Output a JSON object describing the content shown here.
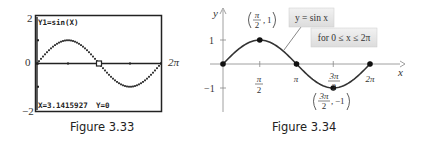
{
  "figures": [
    {
      "caption": "Figure 3.33",
      "chart_data": {
        "type": "line",
        "title": "Y1=sin(X)",
        "function": "sin(x)",
        "x_range": [
          0,
          6.2832
        ],
        "ylim": [
          -2,
          2
        ],
        "x_ticks": [
          0,
          1.5708,
          3.1416,
          4.7124,
          6.2832
        ],
        "y_ticks": [
          -1,
          0,
          1
        ],
        "outer_labels": {
          "y_max": "2",
          "y_mid": "0",
          "y_min": "−2",
          "x_max": "2π"
        },
        "trace_point": {
          "x": 3.1415927,
          "y": 0
        },
        "readout": {
          "x_text": "X=3.1415927",
          "y_text": "Y=0"
        },
        "grid": false
      }
    },
    {
      "caption": "Figure 3.34",
      "chart_data": {
        "type": "line",
        "function": "sin(x)",
        "xlabel": "x",
        "ylabel": "y",
        "x_range": [
          0,
          6.2832
        ],
        "ylim": [
          -1,
          1
        ],
        "x_tick_labels": [
          {
            "value": 1.5708,
            "num": "π",
            "den": "2"
          },
          {
            "value": 3.1416,
            "text": "π"
          },
          {
            "value": 4.7124,
            "num": "3π",
            "den": "2"
          },
          {
            "value": 6.2832,
            "text": "2π"
          }
        ],
        "y_tick_labels": [
          {
            "value": 1,
            "text": "1"
          },
          {
            "value": -1,
            "text": "−1"
          }
        ],
        "points": [
          {
            "x": 0,
            "y": 0
          },
          {
            "x": 1.5708,
            "y": 1
          },
          {
            "x": 3.1416,
            "y": 0
          },
          {
            "x": 4.7124,
            "y": -1
          },
          {
            "x": 6.2832,
            "y": 0
          }
        ],
        "point_labels": {
          "max": {
            "num": "π",
            "den": "2",
            "y": "1"
          },
          "min": {
            "num": "3π",
            "den": "2",
            "y": "−1"
          }
        },
        "callout": {
          "equation": "y = sin x",
          "domain": "for 0 ≤ x ≤ 2π"
        },
        "grid": false
      }
    }
  ]
}
